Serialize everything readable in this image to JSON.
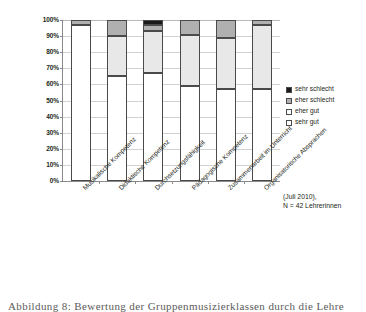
{
  "chart_data": {
    "type": "bar",
    "subtype": "stacked-100-percent-column",
    "title": "",
    "xlabel": "",
    "ylabel": "",
    "ylim": [
      0,
      100
    ],
    "ytick_labels": [
      "100%",
      "90%",
      "80%",
      "70%",
      "60%",
      "50%",
      "40%",
      "30%",
      "20%",
      "10%",
      "0%"
    ],
    "ytick_values": [
      100,
      90,
      80,
      70,
      60,
      50,
      40,
      30,
      20,
      10,
      0
    ],
    "grid": true,
    "legend_position": "right",
    "categories": [
      "Musikalische Kompetenz",
      "Didaktische Kompetenz",
      "Durchsetzungsfähigkeit",
      "Pädagogische Kompetenz",
      "Zusammenarbeit im Unterricht",
      "Organisatorische Absprachen"
    ],
    "series": [
      {
        "name": "sehr gut",
        "color": "#ffffff",
        "values": [
          97,
          65,
          67,
          59,
          57,
          57
        ]
      },
      {
        "name": "eher gut",
        "color": "#e8e8e8",
        "values": [
          0,
          25,
          26,
          32,
          32,
          40
        ]
      },
      {
        "name": "eher schlecht",
        "color": "#b0b0b0",
        "values": [
          3,
          10,
          4,
          9,
          11,
          3
        ]
      },
      {
        "name": "sehr schlecht",
        "color": "#1a1a1a",
        "values": [
          0,
          0,
          3,
          0,
          0,
          0
        ]
      }
    ],
    "annotation": [
      "(Juli 2010),",
      "N = 42 Lehrerinnen"
    ]
  },
  "legend": {
    "items": [
      {
        "label": "sehr schlecht",
        "swatch": "sehr-schlecht"
      },
      {
        "label": "eher schlecht",
        "swatch": "eher-schlecht"
      },
      {
        "label": "eher gut",
        "swatch": "eher-gut"
      },
      {
        "label": "sehr gut",
        "swatch": "sehr-gut"
      }
    ]
  },
  "caption": {
    "text": "Abbildung 8: Bewertung der Gruppenmusizierklassen durch die Lehre"
  }
}
